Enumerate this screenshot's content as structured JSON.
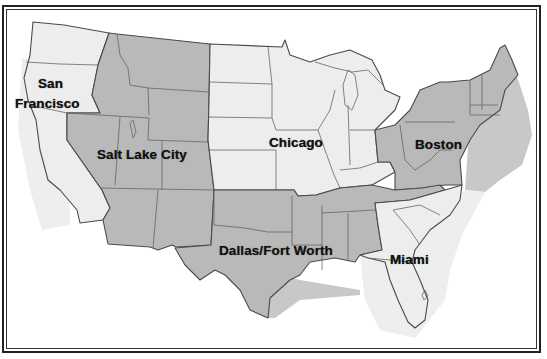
{
  "map": {
    "title": "",
    "colors": {
      "hub_region_fill": "#b9b9b9",
      "other_region_fill": "#ededed",
      "border": "#4a4a4a",
      "coastal_shade_gray": "#c8c8c8",
      "coastal_shade_light": "#eeeeee",
      "background": "#ffffff",
      "label": "#111111"
    },
    "labels": {
      "san_francisco_line1": "San",
      "san_francisco_line2": "Francisco",
      "salt_lake_city": "Salt Lake City",
      "chicago": "Chicago",
      "boston": "Boston",
      "dallas_fort_worth": "Dallas/Fort Worth",
      "miami": "Miami"
    },
    "regions": [
      {
        "hub": "San Francisco",
        "shade": "light",
        "states": [
          "WA",
          "OR",
          "CA"
        ]
      },
      {
        "hub": "Salt Lake City",
        "shade": "gray",
        "states": [
          "ID",
          "MT",
          "WY",
          "NV",
          "UT",
          "CO",
          "AZ",
          "NM"
        ]
      },
      {
        "hub": "Chicago",
        "shade": "light",
        "states": [
          "ND",
          "SD",
          "NE",
          "KS",
          "MN",
          "IA",
          "MO",
          "WI",
          "IL",
          "MI",
          "IN",
          "KY"
        ]
      },
      {
        "hub": "Boston",
        "shade": "gray",
        "states": [
          "OH",
          "PA",
          "NY",
          "WV",
          "VA",
          "MD",
          "DE",
          "NJ",
          "CT",
          "RI",
          "MA",
          "VT",
          "NH",
          "ME"
        ]
      },
      {
        "hub": "Dallas/Fort Worth",
        "shade": "gray",
        "states": [
          "TX",
          "OK",
          "AR",
          "LA",
          "TN",
          "MS",
          "AL"
        ]
      },
      {
        "hub": "Miami",
        "shade": "light",
        "states": [
          "NC",
          "SC",
          "GA",
          "FL"
        ]
      }
    ]
  }
}
